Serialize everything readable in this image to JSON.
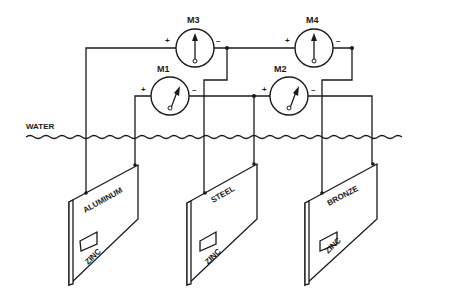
{
  "diagram": {
    "water_label": "WATER",
    "meters": [
      {
        "id": "M1",
        "label": "M1",
        "plus": "+",
        "minus": "–"
      },
      {
        "id": "M2",
        "label": "M2",
        "plus": "+",
        "minus": "–"
      },
      {
        "id": "M3",
        "label": "M3",
        "plus": "+",
        "minus": "–"
      },
      {
        "id": "M4",
        "label": "M4",
        "plus": "+",
        "minus": "–"
      }
    ],
    "plates": [
      {
        "metal": "ALUMINUM",
        "anode": "ZINC"
      },
      {
        "metal": "STEEL",
        "anode": "ZINC"
      },
      {
        "metal": "BRONZE",
        "anode": "ZINC"
      }
    ]
  }
}
